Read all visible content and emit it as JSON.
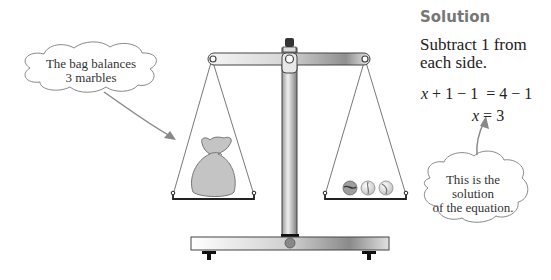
{
  "solution": {
    "heading": "Solution",
    "step": "Subtract 1 from each side.",
    "equation_1": {
      "var": "x",
      "rest": " + 1 − 1  = 4 − 1"
    },
    "equation_2": {
      "var": "x",
      "rest": " = 3"
    }
  },
  "callouts": {
    "left": {
      "line1": "The bag balances",
      "line2": "3 marbles"
    },
    "right": {
      "line1": "This is the",
      "line2": "solution",
      "line3": "of the equation."
    }
  },
  "scale": {
    "left_pan": {
      "content": "bag",
      "label": "x + 1"
    },
    "right_pan": {
      "content": "marbles",
      "count": 3
    }
  },
  "colors": {
    "metal_dark": "#555555",
    "metal_light": "#f2f2f2",
    "bag": "#c4c4c4",
    "arrow": "#888888",
    "heading": "#777777"
  }
}
